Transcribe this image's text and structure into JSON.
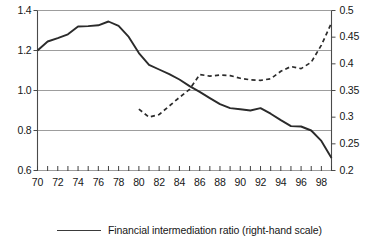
{
  "chart_data": {
    "type": "line",
    "title": "",
    "subtitle": "",
    "xlabel": "",
    "ylabel": "",
    "grid": true,
    "legend_position": "bottom",
    "x": [
      1970,
      1971,
      1972,
      1973,
      1974,
      1975,
      1976,
      1977,
      1978,
      1979,
      1980,
      1981,
      1982,
      1983,
      1984,
      1985,
      1986,
      1987,
      1988,
      1989,
      1990,
      1991,
      1992,
      1993,
      1994,
      1995,
      1996,
      1997,
      1998,
      1999
    ],
    "x_tick_labels": [
      "70",
      "72",
      "74",
      "76",
      "78",
      "80",
      "82",
      "84",
      "86",
      "88",
      "90",
      "92",
      "94",
      "96",
      "98"
    ],
    "x_tick_values": [
      1970,
      1972,
      1974,
      1976,
      1978,
      1980,
      1982,
      1984,
      1986,
      1988,
      1990,
      1992,
      1994,
      1996,
      1998
    ],
    "xlim": [
      1970,
      1999
    ],
    "left_axis": {
      "ylim": [
        0.6,
        1.4
      ],
      "tick_values": [
        0.6,
        0.8,
        1.0,
        1.2,
        1.4
      ],
      "tick_labels": [
        "0.6",
        "0.8",
        "1.0",
        "1.2",
        "1.4"
      ]
    },
    "right_axis": {
      "ylim": [
        0.2,
        0.5
      ],
      "tick_values": [
        0.2,
        0.25,
        0.3,
        0.35,
        0.4,
        0.45,
        0.5
      ],
      "tick_labels": [
        "0.2",
        "0.25",
        "0.3",
        "0.35",
        "0.4",
        "0.45",
        "0.5"
      ]
    },
    "gridline_values_left": [
      0.8,
      1.0,
      1.2,
      1.4
    ],
    "series": [
      {
        "name": "solid-series-left-scale",
        "label": "",
        "style": "solid",
        "color": "#2b2b2b",
        "axis": "left",
        "x": [
          1970,
          1971,
          1972,
          1973,
          1974,
          1975,
          1976,
          1977,
          1978,
          1979,
          1980,
          1981,
          1982,
          1983,
          1984,
          1985,
          1986,
          1987,
          1988,
          1989,
          1990,
          1991,
          1992,
          1993,
          1994,
          1995,
          1996,
          1997,
          1998,
          1999
        ],
        "values": [
          1.2,
          1.245,
          1.262,
          1.281,
          1.32,
          1.322,
          1.326,
          1.345,
          1.323,
          1.268,
          1.187,
          1.128,
          1.105,
          1.082,
          1.055,
          1.022,
          0.993,
          0.962,
          0.932,
          0.912,
          0.906,
          0.9,
          0.912,
          0.884,
          0.852,
          0.822,
          0.82,
          0.8,
          0.748,
          0.663
        ]
      },
      {
        "name": "dashed-series-right-scale",
        "label": "Financial intermediation ratio (right-hand scale)",
        "style": "dashed",
        "color": "#2b2b2b",
        "axis": "right",
        "x": [
          1980,
          1981,
          1982,
          1983,
          1984,
          1985,
          1986,
          1987,
          1988,
          1989,
          1990,
          1991,
          1992,
          1993,
          1994,
          1995,
          1996,
          1997,
          1998,
          1999
        ],
        "values": [
          0.315,
          0.3,
          0.305,
          0.321,
          0.337,
          0.352,
          0.38,
          0.377,
          0.379,
          0.378,
          0.373,
          0.37,
          0.369,
          0.372,
          0.386,
          0.395,
          0.391,
          0.403,
          0.435,
          0.477
        ]
      }
    ]
  },
  "legend": {
    "entries": [
      {
        "label": "Financial intermediation ratio (right-hand scale)",
        "style": "solid"
      }
    ]
  }
}
